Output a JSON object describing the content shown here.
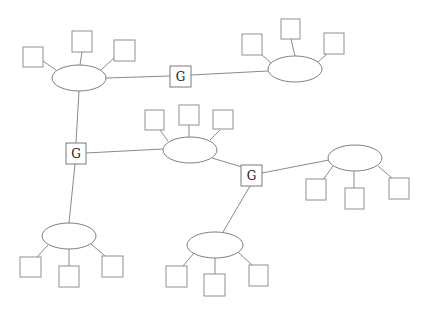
{
  "diagram": {
    "title": "",
    "colors": {
      "background": "#ffffff",
      "line": "#8a8a8a",
      "shape_stroke": "#7f7f7f",
      "gateway_text": "#222222"
    },
    "networks": [
      {
        "id": "net-top-left",
        "cx": 79,
        "cy": 78,
        "rx": 27,
        "ry": 13,
        "hosts": [
          {
            "x": 23,
            "y": 47
          },
          {
            "x": 72,
            "y": 31
          },
          {
            "x": 114,
            "y": 40
          }
        ]
      },
      {
        "id": "net-top-right",
        "cx": 295,
        "cy": 69,
        "rx": 27,
        "ry": 13,
        "hosts": [
          {
            "x": 242,
            "y": 34
          },
          {
            "x": 281,
            "y": 19
          },
          {
            "x": 324,
            "y": 33
          }
        ]
      },
      {
        "id": "net-center",
        "cx": 190,
        "cy": 150,
        "rx": 27,
        "ry": 13,
        "hosts": [
          {
            "x": 145,
            "y": 110
          },
          {
            "x": 179,
            "y": 105
          },
          {
            "x": 213,
            "y": 110
          }
        ]
      },
      {
        "id": "net-right",
        "cx": 355,
        "cy": 158,
        "rx": 27,
        "ry": 13,
        "hosts": [
          {
            "x": 306,
            "y": 179
          },
          {
            "x": 345,
            "y": 188
          },
          {
            "x": 389,
            "y": 178
          }
        ]
      },
      {
        "id": "net-bottom-left",
        "cx": 69,
        "cy": 236,
        "rx": 27,
        "ry": 13,
        "hosts": [
          {
            "x": 20,
            "y": 257
          },
          {
            "x": 59,
            "y": 266
          },
          {
            "x": 102,
            "y": 256
          }
        ]
      },
      {
        "id": "net-bottom-center",
        "cx": 215,
        "cy": 245,
        "rx": 28,
        "ry": 13,
        "hosts": [
          {
            "x": 166,
            "y": 266
          },
          {
            "x": 204,
            "y": 274
          },
          {
            "x": 249,
            "y": 265
          }
        ]
      }
    ],
    "host_size": 20,
    "gateways": [
      {
        "id": "gw-top",
        "label": "G",
        "x": 170,
        "y": 66,
        "w": 21,
        "h": 21
      },
      {
        "id": "gw-left",
        "label": "G",
        "x": 66,
        "y": 143,
        "w": 20,
        "h": 21
      },
      {
        "id": "gw-right",
        "label": "G",
        "x": 241,
        "y": 165,
        "w": 21,
        "h": 21
      }
    ],
    "links": [
      {
        "from": "net-top-left",
        "to": "gw-top"
      },
      {
        "from": "gw-top",
        "to": "net-top-right"
      },
      {
        "from": "net-top-left",
        "to": "gw-left"
      },
      {
        "from": "gw-left",
        "to": "net-center"
      },
      {
        "from": "gw-left",
        "to": "net-bottom-left"
      },
      {
        "from": "net-center",
        "to": "gw-right"
      },
      {
        "from": "gw-right",
        "to": "net-right"
      },
      {
        "from": "gw-right",
        "to": "net-bottom-center"
      }
    ]
  }
}
